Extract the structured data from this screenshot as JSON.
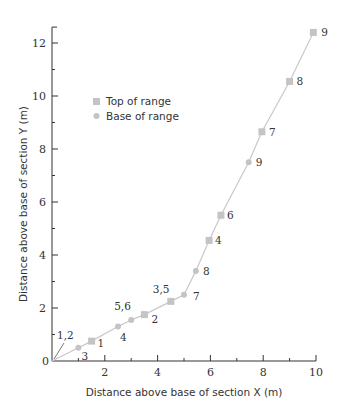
{
  "chart_data": {
    "type": "scatter",
    "title": "",
    "xlabel": "Distance above base of section X (m)",
    "ylabel": "Distance above base of section Y (m)",
    "xlim": [
      0,
      10
    ],
    "ylim": [
      0,
      12.6
    ],
    "x_ticks": [
      0,
      2,
      4,
      6,
      8,
      10
    ],
    "y_ticks": [
      0,
      2,
      4,
      6,
      8,
      10,
      12
    ],
    "grid": false,
    "legend_position": "upper-left inside",
    "line_color": "#c8c8c8",
    "marker_color": "#c4c4c4",
    "line_points": [
      {
        "x": 0,
        "y": 0
      },
      {
        "x": 1.0,
        "y": 0.5
      },
      {
        "x": 1.5,
        "y": 0.75
      },
      {
        "x": 2.5,
        "y": 1.3
      },
      {
        "x": 3.0,
        "y": 1.55
      },
      {
        "x": 3.5,
        "y": 1.75
      },
      {
        "x": 4.5,
        "y": 2.25
      },
      {
        "x": 5.0,
        "y": 2.5
      },
      {
        "x": 5.45,
        "y": 3.4
      },
      {
        "x": 5.95,
        "y": 4.55
      },
      {
        "x": 6.4,
        "y": 5.5
      },
      {
        "x": 7.45,
        "y": 7.5
      },
      {
        "x": 7.95,
        "y": 8.65
      },
      {
        "x": 9.0,
        "y": 10.55
      },
      {
        "x": 9.9,
        "y": 12.4
      }
    ],
    "series": [
      {
        "name": "Top of range",
        "marker": "square",
        "points": [
          {
            "x": 0.0,
            "y": 0.0,
            "label": "1,2"
          },
          {
            "x": 1.5,
            "y": 0.75,
            "label": "1"
          },
          {
            "x": 3.5,
            "y": 1.75,
            "label": "2"
          },
          {
            "x": 4.5,
            "y": 2.25,
            "label": "3,5"
          },
          {
            "x": 5.95,
            "y": 4.55,
            "label": "4"
          },
          {
            "x": 6.4,
            "y": 5.5,
            "label": "6"
          },
          {
            "x": 7.95,
            "y": 8.65,
            "label": "7"
          },
          {
            "x": 9.0,
            "y": 10.55,
            "label": "8"
          },
          {
            "x": 9.9,
            "y": 12.4,
            "label": "9"
          }
        ]
      },
      {
        "name": "Base of range",
        "marker": "circle",
        "points": [
          {
            "x": 1.0,
            "y": 0.5,
            "label": "3"
          },
          {
            "x": 2.5,
            "y": 1.3,
            "label": "4"
          },
          {
            "x": 3.0,
            "y": 1.55,
            "label": "5,6"
          },
          {
            "x": 5.0,
            "y": 2.5,
            "label": "7"
          },
          {
            "x": 5.45,
            "y": 3.4,
            "label": "8"
          },
          {
            "x": 7.45,
            "y": 7.5,
            "label": "9"
          }
        ]
      }
    ]
  },
  "legend": {
    "top_label": "Top of range",
    "base_label": "Base of range"
  },
  "axes": {
    "xlabel": "Distance above base of section X (m)",
    "ylabel": "Distance above base of section Y (m)",
    "x_tick_labels": [
      "0",
      "2",
      "4",
      "6",
      "8",
      "10"
    ],
    "y_tick_labels": [
      "2",
      "4",
      "6",
      "8",
      "10",
      "12"
    ]
  }
}
